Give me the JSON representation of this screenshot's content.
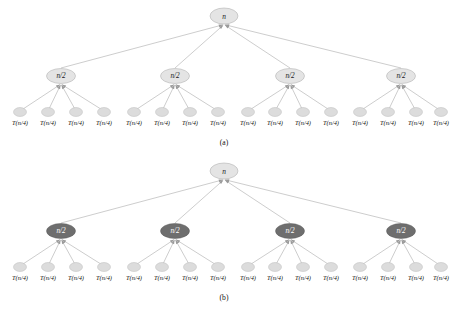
{
  "document": {
    "kind": "recursion-tree-diagram",
    "background_color": "#ffffff"
  },
  "palette": {
    "edge_color": "#9a9a9a",
    "node_light_fill": "#e4e4e4",
    "node_light_stroke": "#a8a8a8",
    "node_dark_fill": "#6e6e6e",
    "node_dark_stroke": "#5a5a5a",
    "leaf_fill": "#dcdcdc",
    "leaf_stroke": "#b0b0b0",
    "text_dark": "#1a1a1a",
    "text_light": "#ffffff"
  },
  "figures": [
    {
      "id": "figure-a",
      "caption": "(a)",
      "root": {
        "label": "n",
        "style": "light"
      },
      "level2_style": "light",
      "level2": [
        {
          "label": "n/2"
        },
        {
          "label": "n/2"
        },
        {
          "label": "n/2"
        },
        {
          "label": "n/2"
        }
      ],
      "leaves": [
        "T(n/4)",
        "T(n/4)",
        "T(n/4)",
        "T(n/4)",
        "T(n/4)",
        "T(n/4)",
        "T(n/4)",
        "T(n/4)",
        "T(n/4)",
        "T(n/4)",
        "T(n/4)",
        "T(n/4)",
        "T(n/4)",
        "T(n/4)",
        "T(n/4)",
        "T(n/4)"
      ]
    },
    {
      "id": "figure-b",
      "caption": "(b)",
      "root": {
        "label": "n",
        "style": "light"
      },
      "level2_style": "dark",
      "level2": [
        {
          "label": "n/2"
        },
        {
          "label": "n/2"
        },
        {
          "label": "n/2"
        },
        {
          "label": "n/2"
        }
      ],
      "leaves": [
        "T(n/4)",
        "T(n/4)",
        "T(n/4)",
        "T(n/4)",
        "T(n/4)",
        "T(n/4)",
        "T(n/4)",
        "T(n/4)",
        "T(n/4)",
        "T(n/4)",
        "T(n/4)",
        "T(n/4)",
        "T(n/4)",
        "T(n/4)",
        "T(n/4)",
        "T(n/4)"
      ]
    }
  ],
  "geometry": {
    "root": {
      "cx": 224,
      "cy": 16,
      "rx": 14,
      "ry": 8
    },
    "level2_cx": [
      61,
      175,
      290,
      401
    ],
    "level2_cy": 76,
    "level2_rx": 14.5,
    "level2_ry": 7.5,
    "leaf_cy": 112,
    "leaf_label_cy": 122,
    "leaf_rx": 6.5,
    "leaf_ry": 4.5,
    "group_leaf_cx": [
      [
        20,
        48,
        76,
        104
      ],
      [
        134,
        162,
        190,
        218
      ],
      [
        248,
        275,
        303,
        331
      ],
      [
        360,
        388,
        416,
        441
      ]
    ],
    "caption_cy": 142
  }
}
